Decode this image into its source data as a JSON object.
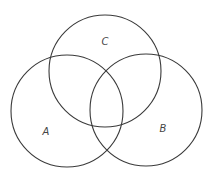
{
  "diagram": {
    "type": "venn",
    "stroke_color": "#3a3a3a",
    "label_color": "#444444",
    "sets": [
      {
        "id": "A",
        "label": "A",
        "cx": 67,
        "cy": 111,
        "r": 56,
        "label_x": 46,
        "label_y": 132
      },
      {
        "id": "B",
        "label": "B",
        "cx": 146,
        "cy": 110,
        "r": 56,
        "label_x": 163,
        "label_y": 129
      },
      {
        "id": "C",
        "label": "C",
        "cx": 105,
        "cy": 71,
        "r": 56,
        "label_x": 105,
        "label_y": 42
      }
    ]
  }
}
